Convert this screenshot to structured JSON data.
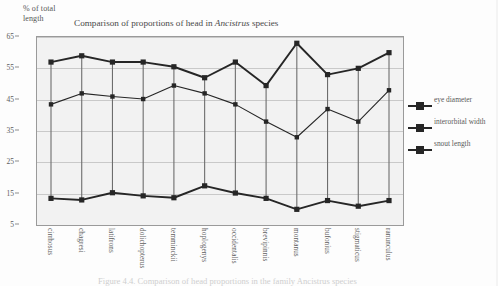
{
  "figure": {
    "title": "Comparison of proportions of head in ",
    "title_genus": "Ancistrus",
    "title_tail": " species",
    "ylabel": "% of total length",
    "caption": "Figure 4.4.  Comparison of head proportions in the family Ancistrus species"
  },
  "legend": {
    "position": "right",
    "items": [
      {
        "label": "eye diameter",
        "color": "#262626"
      },
      {
        "label": "interorbital width",
        "color": "#262626"
      },
      {
        "label": "snout length",
        "color": "#262626"
      }
    ]
  },
  "chart_data": {
    "type": "line",
    "title": "Comparison of proportions of head in Ancistrus species",
    "xlabel": "",
    "ylabel": "% of total length",
    "ylim": [
      5,
      65
    ],
    "yticks": [
      65,
      55,
      45,
      35,
      25,
      15,
      5
    ],
    "grid": true,
    "legend_position": "right",
    "categories": [
      "cirrhosus",
      "chagresi",
      "latifrons",
      "dolichopterus",
      "temminckii",
      "hoplogenys",
      "occidentalis",
      "brevipinnis",
      "montanus",
      "bufonius",
      "stigmaticus",
      "ranunculus"
    ],
    "series": [
      {
        "name": "snout length",
        "color": "#262626",
        "values": [
          57.0,
          59.0,
          57.0,
          57.0,
          55.5,
          52.0,
          57.0,
          49.5,
          63.0,
          53.0,
          55.0,
          60.0
        ]
      },
      {
        "name": "interorbital width",
        "color": "#262626",
        "values": [
          43.5,
          47.0,
          46.0,
          45.2,
          49.5,
          47.0,
          43.5,
          38.0,
          33.0,
          42.0,
          38.0,
          48.0
        ]
      },
      {
        "name": "eye diameter",
        "color": "#262626",
        "values": [
          13.5,
          13.0,
          15.3,
          14.3,
          13.7,
          17.5,
          15.2,
          13.5,
          10.0,
          12.8,
          11.0,
          12.8
        ]
      }
    ]
  }
}
